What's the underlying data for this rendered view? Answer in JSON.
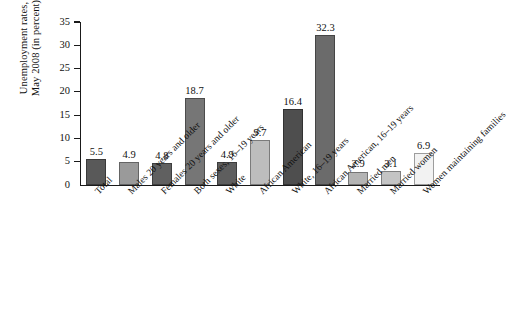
{
  "chart_data": {
    "type": "bar",
    "title": "",
    "subtitle": "",
    "xlabel": "",
    "ylabel": "Unemployment rates, May 2008 (in percent)",
    "ylabel_lines": [
      "Unemployment rates,",
      "May 2008 (in percent)"
    ],
    "ylim": [
      0,
      35
    ],
    "yticks": [
      0,
      5,
      10,
      15,
      20,
      25,
      30,
      35
    ],
    "ytick_labels": [
      "0",
      "5",
      "10",
      "15",
      "20",
      "25",
      "30",
      "35"
    ],
    "grid": false,
    "legend": "none",
    "categories": [
      "Total",
      "Males 20 years and older",
      "Females 20 years and older",
      "Both sexes, 16–19 years",
      "White",
      "African American",
      "White, 16–19 years",
      "African American, 16–19 years",
      "Married men",
      "Married women",
      "Women maintaining families"
    ],
    "values": [
      5.5,
      4.9,
      4.8,
      18.7,
      4.9,
      9.7,
      16.4,
      32.3,
      2.9,
      3.1,
      6.9
    ],
    "value_labels": [
      "5.5",
      "4.9",
      "4.8",
      "18.7",
      "4.9",
      "9.7",
      "16.4",
      "32.3",
      "2.9",
      "3.1",
      "6.9"
    ],
    "bar_colors": [
      "#595959",
      "#9a9a9a",
      "#606060",
      "#767676",
      "#5e5e5e",
      "#bdbdbd",
      "#4e4e4e",
      "#6b6b6b",
      "#b4b4b4",
      "#c4c4c4",
      "#f2f2f2"
    ]
  }
}
